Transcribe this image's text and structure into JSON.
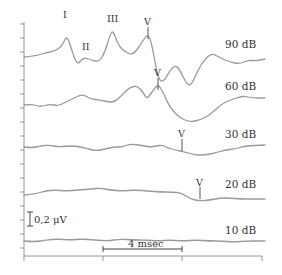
{
  "chart_data": {
    "type": "line",
    "title": "",
    "xlabel": "",
    "ylabel": "",
    "grid": false,
    "legend": "none",
    "series": [
      {
        "name": "90 dB",
        "label": "90 dB",
        "peaks": [
          "I",
          "II",
          "III",
          "V"
        ],
        "points": [
          [
            24,
            57
          ],
          [
            35,
            56
          ],
          [
            45,
            53
          ],
          [
            55,
            51
          ],
          [
            62,
            46
          ],
          [
            67,
            35
          ],
          [
            71,
            48
          ],
          [
            77,
            65
          ],
          [
            82,
            59
          ],
          [
            86,
            58
          ],
          [
            91,
            60
          ],
          [
            99,
            62
          ],
          [
            105,
            52
          ],
          [
            110,
            35
          ],
          [
            113,
            30
          ],
          [
            118,
            45
          ],
          [
            125,
            52
          ],
          [
            133,
            55
          ],
          [
            141,
            44
          ],
          [
            148,
            33
          ],
          [
            152,
            45
          ],
          [
            156,
            68
          ],
          [
            160,
            82
          ],
          [
            165,
            80
          ],
          [
            170,
            70
          ],
          [
            176,
            65
          ],
          [
            181,
            72
          ],
          [
            186,
            83
          ],
          [
            191,
            86
          ],
          [
            197,
            72
          ],
          [
            204,
            60
          ],
          [
            212,
            53
          ],
          [
            220,
            58
          ],
          [
            230,
            62
          ],
          [
            240,
            64
          ],
          [
            248,
            60
          ],
          [
            255,
            61
          ],
          [
            265,
            59
          ]
        ]
      },
      {
        "name": "60 dB",
        "label": "60 dB",
        "peaks": [
          "V"
        ],
        "points": [
          [
            24,
            105
          ],
          [
            32,
            104
          ],
          [
            40,
            107
          ],
          [
            50,
            104
          ],
          [
            58,
            106
          ],
          [
            66,
            102
          ],
          [
            74,
            98
          ],
          [
            83,
            94
          ],
          [
            90,
            99
          ],
          [
            100,
            100
          ],
          [
            108,
            102
          ],
          [
            115,
            102
          ],
          [
            122,
            95
          ],
          [
            130,
            87
          ],
          [
            138,
            86
          ],
          [
            144,
            94
          ],
          [
            147,
            99
          ],
          [
            152,
            92
          ],
          [
            158,
            84
          ],
          [
            163,
            92
          ],
          [
            170,
            108
          ],
          [
            180,
            118
          ],
          [
            190,
            122
          ],
          [
            200,
            120
          ],
          [
            210,
            115
          ],
          [
            220,
            105
          ],
          [
            230,
            100
          ],
          [
            240,
            97
          ],
          [
            245,
            96
          ],
          [
            252,
            98
          ],
          [
            265,
            98
          ]
        ]
      },
      {
        "name": "30 dB",
        "label": "30 dB",
        "peaks": [
          "V"
        ],
        "points": [
          [
            24,
            147
          ],
          [
            32,
            148
          ],
          [
            40,
            146
          ],
          [
            50,
            145
          ],
          [
            58,
            147
          ],
          [
            66,
            146
          ],
          [
            76,
            146
          ],
          [
            85,
            148
          ],
          [
            96,
            151
          ],
          [
            105,
            149
          ],
          [
            114,
            147
          ],
          [
            122,
            147
          ],
          [
            130,
            144
          ],
          [
            138,
            145
          ],
          [
            145,
            146
          ],
          [
            150,
            147
          ],
          [
            157,
            146
          ],
          [
            162,
            145
          ],
          [
            168,
            148
          ],
          [
            175,
            150
          ],
          [
            185,
            152
          ],
          [
            195,
            155
          ],
          [
            205,
            155
          ],
          [
            215,
            153
          ],
          [
            225,
            150
          ],
          [
            235,
            149
          ],
          [
            245,
            146
          ],
          [
            265,
            145
          ]
        ]
      },
      {
        "name": "20 dB",
        "label": "20 dB",
        "peaks": [
          "V"
        ],
        "points": [
          [
            24,
            195
          ],
          [
            35,
            194
          ],
          [
            45,
            191
          ],
          [
            55,
            190
          ],
          [
            66,
            191
          ],
          [
            78,
            190
          ],
          [
            92,
            189
          ],
          [
            100,
            188
          ],
          [
            110,
            190
          ],
          [
            122,
            191
          ],
          [
            135,
            190
          ],
          [
            148,
            191
          ],
          [
            160,
            192
          ],
          [
            172,
            192
          ],
          [
            182,
            193
          ],
          [
            190,
            199
          ],
          [
            200,
            201
          ],
          [
            210,
            200
          ],
          [
            220,
            198
          ],
          [
            230,
            198
          ],
          [
            240,
            199
          ],
          [
            250,
            199
          ],
          [
            265,
            199
          ]
        ]
      },
      {
        "name": "10 dB",
        "label": "10 dB",
        "peaks": [],
        "points": [
          [
            24,
            241
          ],
          [
            35,
            242
          ],
          [
            46,
            240
          ],
          [
            58,
            239
          ],
          [
            70,
            240
          ],
          [
            82,
            239
          ],
          [
            95,
            240
          ],
          [
            108,
            241
          ],
          [
            120,
            239
          ],
          [
            133,
            240
          ],
          [
            146,
            240
          ],
          [
            158,
            241
          ],
          [
            170,
            240
          ],
          [
            182,
            241
          ],
          [
            196,
            240
          ],
          [
            210,
            241
          ],
          [
            222,
            241
          ],
          [
            234,
            242
          ],
          [
            246,
            241
          ],
          [
            265,
            241
          ]
        ]
      }
    ],
    "peak_markers": [
      {
        "series": "90 dB",
        "label": "I",
        "x": 67,
        "y": 35
      },
      {
        "series": "90 dB",
        "label": "II",
        "x": 86,
        "y": 58
      },
      {
        "series": "90 dB",
        "label": "III",
        "x": 113,
        "y": 30
      },
      {
        "series": "90 dB",
        "label": "V",
        "x": 148,
        "y": 33
      },
      {
        "series": "60 dB",
        "label": "V",
        "x": 158,
        "y": 84
      },
      {
        "series": "30 dB",
        "label": "V",
        "x": 182,
        "y": 145
      },
      {
        "series": "20 dB",
        "label": "V",
        "x": 200,
        "y": 193
      }
    ],
    "scale_bars": {
      "amplitude": {
        "label": "0,2 μV"
      },
      "time": {
        "label": "4 msec"
      }
    },
    "x_ticks": [
      24,
      103,
      182,
      262
    ],
    "y_ticks_px": [
      24,
      38,
      52,
      66,
      80,
      94,
      108,
      122,
      136,
      150,
      164,
      178,
      192,
      206,
      220,
      234,
      248
    ]
  },
  "labels": {
    "s90": "90 dB",
    "s60": "60 dB",
    "s30": "30 dB",
    "s20": "20 dB",
    "s10": "10 dB",
    "peak_I": "I",
    "peak_II": "II",
    "peak_III": "III",
    "peak_V": "V",
    "amp_scale": "0,2 μV",
    "time_scale": "4 msec"
  }
}
